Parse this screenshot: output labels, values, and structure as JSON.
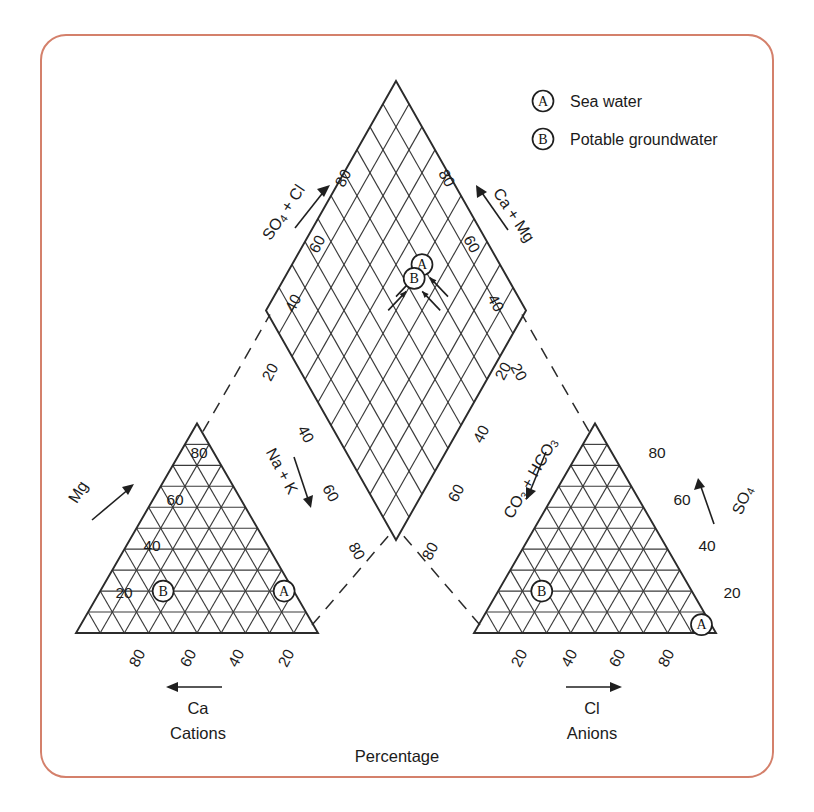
{
  "figure": {
    "type": "piper-trilinear-diagram",
    "border_color": "#d4806b",
    "line_color": "#2b2b2b",
    "background": "#ffffff"
  },
  "legend": {
    "items": [
      {
        "key": "A",
        "label": "Sea water"
      },
      {
        "key": "B",
        "label": "Potable groundwater"
      }
    ]
  },
  "captions": {
    "cations": "Cations",
    "anions": "Anions",
    "percentage": "Percentage"
  },
  "cation_triangle": {
    "name": "Cations",
    "left_axis": {
      "title": "Mg",
      "ticks": [
        "20",
        "40",
        "60",
        "80"
      ],
      "arrow": "up-right"
    },
    "bottom_axis": {
      "title": "Ca",
      "ticks": [
        "80",
        "60",
        "40",
        "20"
      ],
      "arrow": "left"
    },
    "right_axis": {
      "title": "Na + K",
      "ticks": [
        "20",
        "40",
        "60",
        "80"
      ],
      "arrow": "down-right"
    },
    "points": [
      {
        "key": "A",
        "ca": 4,
        "mg": 20,
        "nak": 76
      },
      {
        "key": "B",
        "ca": 54,
        "mg": 20,
        "nak": 26
      }
    ]
  },
  "anion_triangle": {
    "name": "Anions",
    "right_axis": {
      "title": "SO4",
      "title_main": "SO",
      "title_sub": "4",
      "ticks": [
        "20",
        "40",
        "60",
        "80"
      ],
      "arrow": "up-left"
    },
    "bottom_axis": {
      "title": "Cl",
      "ticks": [
        "20",
        "40",
        "60",
        "80"
      ],
      "arrow": "right"
    },
    "left_axis": {
      "title": "CO3 + HCO3",
      "ticks": [
        "20",
        "40",
        "60",
        "80"
      ],
      "arrow": "down-right"
    },
    "points": [
      {
        "key": "A",
        "cl": 92,
        "so4": 4,
        "co3hco3": 4
      },
      {
        "key": "B",
        "cl": 18,
        "so4": 20,
        "co3hco3": 62
      }
    ]
  },
  "diamond": {
    "upper_left_axis": {
      "title": "SO4 + Cl",
      "title_main": "SO",
      "title_sub": "4",
      "title_rest": " + Cl",
      "ticks": [
        "20",
        "40",
        "60",
        "80"
      ],
      "arrow": "up-right"
    },
    "upper_right_axis": {
      "title": "Ca + Mg",
      "ticks": [
        "20",
        "40",
        "60",
        "80"
      ],
      "arrow": "up-left"
    },
    "lower_left_axis": {
      "title": "Na + K",
      "ticks": [
        "20",
        "40",
        "60",
        "80"
      ],
      "arrow": "down-right"
    },
    "lower_right_axis": {
      "title": "CO3 + HCO3",
      "ticks": [
        "20",
        "40",
        "60",
        "80"
      ],
      "arrow": "down-left"
    },
    "points": [
      {
        "key": "A",
        "camg": 24,
        "so4cl": 96
      },
      {
        "key": "B",
        "camg": 74,
        "so4cl": 40
      }
    ]
  },
  "chart_data": {
    "type": "scatter",
    "title": "",
    "xlabel": "Percentage",
    "ylabel": "",
    "grid": true,
    "legend_position": "top-right",
    "axis_range": [
      0,
      100
    ],
    "tick_values": [
      20,
      40,
      60,
      80
    ],
    "series": [
      {
        "name": "Sea water",
        "key": "A",
        "cations_percent": {
          "Ca": 4,
          "Mg": 20,
          "Na_K": 76
        },
        "anions_percent": {
          "Cl": 92,
          "SO4": 4,
          "CO3_HCO3": 4
        },
        "diamond_percent": {
          "Ca_Mg": 24,
          "SO4_Cl": 96
        }
      },
      {
        "name": "Potable groundwater",
        "key": "B",
        "cations_percent": {
          "Ca": 54,
          "Mg": 20,
          "Na_K": 26
        },
        "anions_percent": {
          "Cl": 18,
          "SO4": 20,
          "CO3_HCO3": 62
        },
        "diamond_percent": {
          "Ca_Mg": 74,
          "SO4_Cl": 40
        }
      }
    ]
  }
}
